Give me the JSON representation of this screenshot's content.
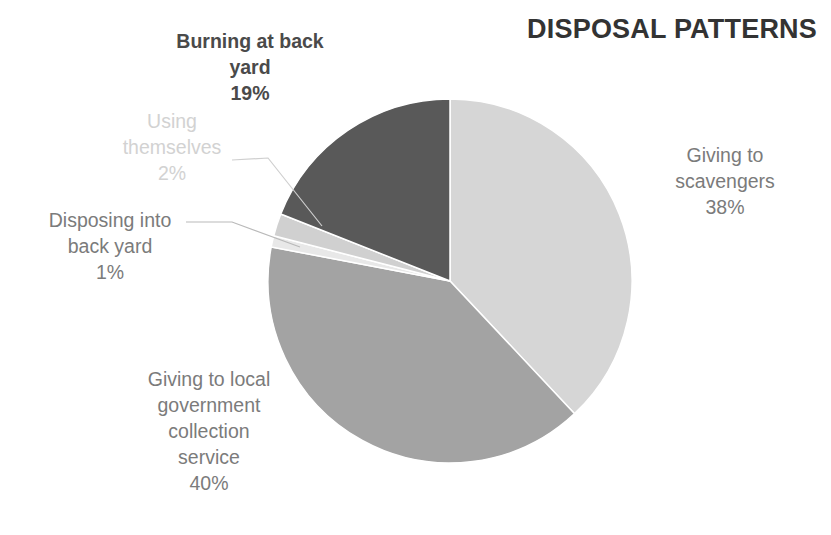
{
  "chart_data": {
    "type": "pie",
    "title": "DISPOSAL PATTERNS",
    "xlabel": "",
    "ylabel": "",
    "legend_position": "none",
    "grid": false,
    "unit": "%",
    "start_angle_deg": 0,
    "direction": "clockwise",
    "categories": [
      "Giving to scavengers",
      "Giving to local government collection service",
      "Disposing into back yard",
      "Using themselves",
      "Burning at back yard"
    ],
    "values": [
      38,
      40,
      1,
      2,
      19
    ],
    "colors": [
      "#d6d6d6",
      "#a3a3a3",
      "#e8e8e8",
      "#d0d0d0",
      "#595959"
    ],
    "slices": [
      {
        "label": "Giving to scavengers",
        "value": 38,
        "display": "38%",
        "color": "#d6d6d6"
      },
      {
        "label": "Giving to local government collection service",
        "value": 40,
        "display": "40%",
        "color": "#a3a3a3"
      },
      {
        "label": "Disposing into back yard",
        "value": 1,
        "display": "1%",
        "color": "#e8e8e8"
      },
      {
        "label": "Using themselves",
        "value": 2,
        "display": "2%",
        "color": "#d0d0d0"
      },
      {
        "label": "Burning at back yard",
        "value": 19,
        "display": "19%",
        "color": "#595959"
      }
    ]
  },
  "labels": {
    "burning": "Burning at back\nyard\n19%",
    "using": "Using\nthemselves\n2%",
    "disposing": "Disposing into\nback yard\n1%",
    "local": "Giving to local\ngovernment\ncollection\nservice\n40%",
    "scavengers": "Giving to\nscavengers\n38%"
  },
  "title": "DISPOSAL PATTERNS"
}
